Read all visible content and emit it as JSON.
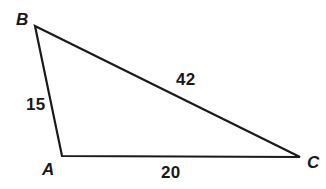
{
  "figure": {
    "type": "triangle-diagram",
    "background_color": "#ffffff",
    "stroke_color": "#1a1a1a",
    "stroke_width": 2.2,
    "canvas": {
      "width": 326,
      "height": 189
    },
    "vertices": {
      "B": {
        "label": "B",
        "x": 35,
        "y": 26
      },
      "A": {
        "label": "A",
        "x": 62,
        "y": 156
      },
      "C": {
        "label": "C",
        "x": 300,
        "y": 157
      }
    },
    "sides": {
      "AB": {
        "length_label": "15",
        "from": "A",
        "to": "B"
      },
      "BC": {
        "length_label": "42",
        "from": "B",
        "to": "C"
      },
      "AC": {
        "length_label": "20",
        "from": "A",
        "to": "C"
      }
    }
  }
}
